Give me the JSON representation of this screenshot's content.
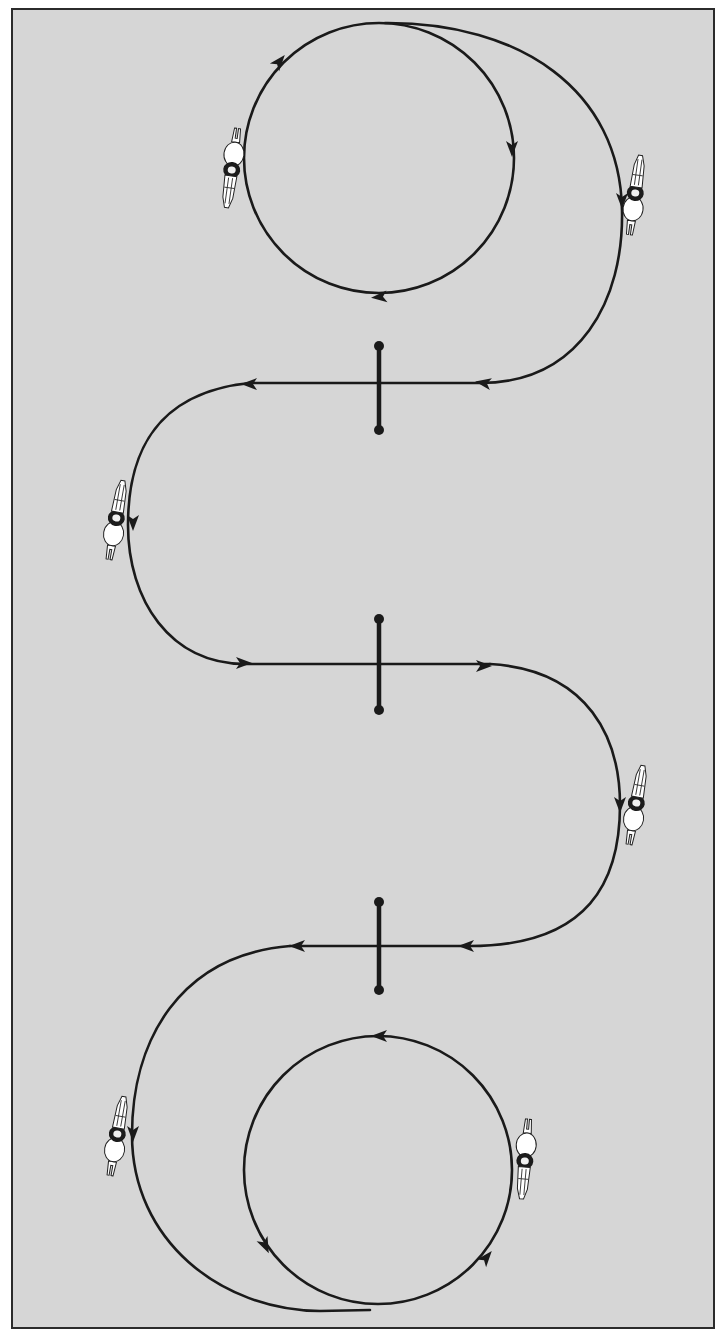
{
  "diagram": {
    "title": "",
    "background_color": "#d6d6d6",
    "line_color": "#1a1a1a",
    "frame_color": "#2b2b2b",
    "elements": {
      "top_circle": {
        "cx": 379,
        "cy": 158,
        "r": 135,
        "direction": "clockwise"
      },
      "bottom_circle": {
        "cx": 378,
        "cy": 1170,
        "r": 134,
        "direction": "counterclockwise"
      },
      "gates": [
        {
          "id": "gate-1",
          "x": 379,
          "y_top": 346,
          "y_bottom": 430,
          "path_y": 383,
          "travel": "right-to-left"
        },
        {
          "id": "gate-2",
          "x": 379,
          "y_top": 619,
          "y_bottom": 710,
          "path_y": 664,
          "travel": "left-to-right"
        },
        {
          "id": "gate-3",
          "x": 379,
          "y_top": 902,
          "y_bottom": 990,
          "path_y": 946,
          "travel": "right-to-left"
        }
      ],
      "riders": [
        {
          "id": "rider-1",
          "x": 232,
          "y": 168,
          "heading": "up"
        },
        {
          "id": "rider-2",
          "x": 635,
          "y": 195,
          "heading": "down"
        },
        {
          "id": "rider-3",
          "x": 116,
          "y": 520,
          "heading": "down"
        },
        {
          "id": "rider-4",
          "x": 636,
          "y": 805,
          "heading": "down"
        },
        {
          "id": "rider-5",
          "x": 117,
          "y": 1135,
          "heading": "down"
        },
        {
          "id": "rider-6",
          "x": 525,
          "y": 1158,
          "heading": "up"
        }
      ]
    }
  }
}
